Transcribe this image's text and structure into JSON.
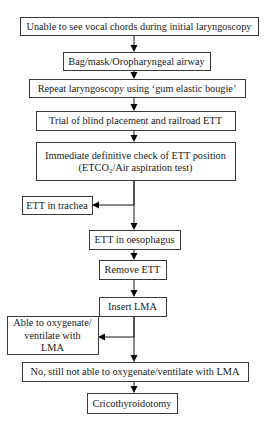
{
  "diagram": {
    "type": "flowchart",
    "colors": {
      "box_border": "#3a3a3a",
      "line": "#1a1a1a",
      "text": "#1a1a1a",
      "background": "#ffffff"
    },
    "nodes": [
      {
        "id": "unable",
        "lines": [
          "Unable to see vocal chords during initial laryngoscopy"
        ],
        "x": 20,
        "y": 17,
        "w": 238,
        "h": 18
      },
      {
        "id": "bag",
        "lines": [
          "Bag/mask/Oropharyngeal airway"
        ],
        "x": 63,
        "y": 52,
        "w": 147,
        "h": 18
      },
      {
        "id": "repeat",
        "lines": [
          "Repeat laryngoscopy using ‘gum elastic bougie’"
        ],
        "x": 29,
        "y": 79,
        "w": 216,
        "h": 18
      },
      {
        "id": "trial",
        "lines": [
          "Trial of blind placement and railroad ETT"
        ],
        "x": 36,
        "y": 111,
        "w": 199,
        "h": 19
      },
      {
        "id": "check",
        "lines": [
          "Immediate definitive check of ETT position",
          "(ETCO₂/Air aspiration test)"
        ],
        "x": 36,
        "y": 142,
        "w": 199,
        "h": 38
      },
      {
        "id": "trachea",
        "lines": [
          "ETT in trachea"
        ],
        "x": 22,
        "y": 196,
        "w": 70,
        "h": 18
      },
      {
        "id": "oesophagus",
        "lines": [
          "ETT in oesophagus"
        ],
        "x": 89,
        "y": 230,
        "w": 91,
        "h": 19
      },
      {
        "id": "remove",
        "lines": [
          "Remove ETT"
        ],
        "x": 99,
        "y": 260,
        "w": 67,
        "h": 19
      },
      {
        "id": "insert",
        "lines": [
          "Insert LMA"
        ],
        "x": 99,
        "y": 297,
        "w": 67,
        "h": 19
      },
      {
        "id": "able",
        "lines": [
          "Able to oxygenate/",
          "ventilate with",
          "LMA"
        ],
        "x": 7,
        "y": 316,
        "w": 91,
        "h": 38
      },
      {
        "id": "notable",
        "lines": [
          "No, still not able to oxygenate/ventilate with LMA"
        ],
        "x": 22,
        "y": 362,
        "w": 226,
        "h": 19
      },
      {
        "id": "crico",
        "lines": [
          "Cricothyroidotomy"
        ],
        "x": 87,
        "y": 393,
        "w": 90,
        "h": 20
      }
    ],
    "edges": [
      {
        "from": "unable",
        "to": "bag",
        "points": [
          [
            134,
            35
          ],
          [
            134,
            52
          ]
        ]
      },
      {
        "from": "bag",
        "to": "repeat",
        "points": [
          [
            134,
            70
          ],
          [
            134,
            79
          ]
        ]
      },
      {
        "from": "repeat",
        "to": "trial",
        "points": [
          [
            134,
            97
          ],
          [
            134,
            111
          ]
        ]
      },
      {
        "from": "trial",
        "to": "check",
        "points": [
          [
            134,
            130
          ],
          [
            134,
            142
          ]
        ]
      },
      {
        "from": "check",
        "to": "trachea",
        "points": [
          [
            134,
            180
          ],
          [
            134,
            205
          ],
          [
            92,
            205
          ]
        ],
        "dir": "left"
      },
      {
        "from": "check",
        "to": "oesophagus",
        "points": [
          [
            134,
            180
          ],
          [
            134,
            230
          ]
        ]
      },
      {
        "from": "oesophagus",
        "to": "remove",
        "points": [
          [
            134,
            249
          ],
          [
            134,
            260
          ]
        ]
      },
      {
        "from": "remove",
        "to": "insert",
        "points": [
          [
            134,
            279
          ],
          [
            134,
            297
          ]
        ]
      },
      {
        "from": "insert",
        "to": "able",
        "points": [
          [
            134,
            316
          ],
          [
            134,
            337
          ],
          [
            98,
            337
          ]
        ],
        "dir": "left"
      },
      {
        "from": "insert",
        "to": "notable",
        "points": [
          [
            134,
            316
          ],
          [
            134,
            362
          ]
        ]
      },
      {
        "from": "notable",
        "to": "crico",
        "points": [
          [
            134,
            381
          ],
          [
            134,
            393
          ]
        ]
      }
    ]
  }
}
